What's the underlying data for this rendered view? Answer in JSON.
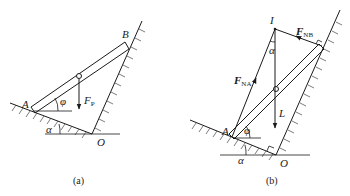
{
  "figure": {
    "panels": [
      {
        "id": "a",
        "caption": "(a)",
        "labels": {
          "A": "A",
          "B": "B",
          "O": "O",
          "phi": "φ",
          "alpha": "α",
          "force": "F",
          "force_sub": "P"
        }
      },
      {
        "id": "b",
        "caption": "(b)",
        "labels": {
          "A": "A",
          "O": "O",
          "I": "I",
          "phi": "φ",
          "alpha_bottom": "α",
          "alpha_top": "α",
          "FNA": "F",
          "FNA_sub": "NA",
          "FNB": "F",
          "FNB_sub": "NB",
          "L": "L"
        }
      }
    ]
  },
  "colors": {
    "line": "#1a1a1a",
    "background": "#ffffff"
  }
}
